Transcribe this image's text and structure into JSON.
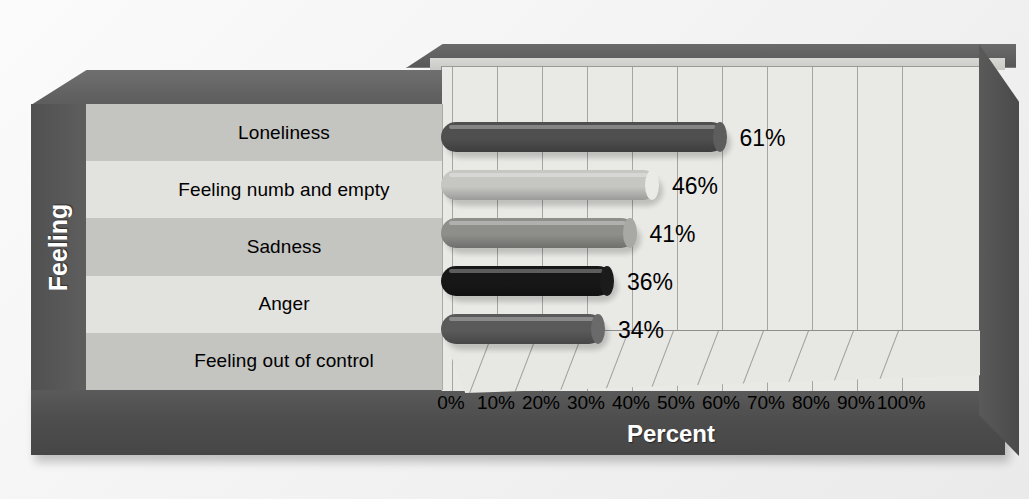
{
  "chart_data": {
    "type": "bar",
    "orientation": "horizontal",
    "title": "",
    "xlabel": "Percent",
    "ylabel": "Feeling",
    "categories": [
      "Loneliness",
      "Feeling numb and empty",
      "Sadness",
      "Anger",
      "Feeling out of control"
    ],
    "values": [
      61,
      46,
      41,
      36,
      34
    ],
    "value_labels": [
      "61%",
      "46%",
      "41%",
      "36%",
      "34%"
    ],
    "xlim": [
      0,
      100
    ],
    "xticks": [
      0,
      10,
      20,
      30,
      40,
      50,
      60,
      70,
      80,
      90,
      100
    ],
    "xtick_labels": [
      "0%",
      "10%",
      "20%",
      "30%",
      "40%",
      "50%",
      "60%",
      "70%",
      "80%",
      "90%",
      "100%"
    ],
    "grid": true,
    "grid_axis": "x",
    "legend": false,
    "style": "3d-perspective",
    "bar_colors": [
      "#4f4f4f",
      "#c6c6c3",
      "#8e8e8b",
      "#171717",
      "#5a5a5a"
    ],
    "series": [
      {
        "name": "Percent",
        "values": [
          61,
          46,
          41,
          36,
          34
        ]
      }
    ]
  },
  "axes": {
    "y_title": "Feeling",
    "x_title": "Percent"
  },
  "colors": {
    "background": "#f4f4f4",
    "plinth": "#4e4e4e",
    "wall": "#e9e9e6",
    "band_dark": "#c4c4c1",
    "band_light": "#e2e2df",
    "gridline": "#8d8d8d",
    "text": "#000000",
    "axis_title_text": "#ffffff"
  }
}
